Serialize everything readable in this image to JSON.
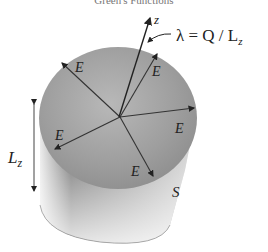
{
  "header": {
    "running_title": "Green's Functions"
  },
  "figure": {
    "axis_label": "z",
    "equation": "λ = Q / L",
    "equation_subscript": "z",
    "field_labels": [
      "E",
      "E",
      "E",
      "E",
      "E",
      "E"
    ],
    "length_label": "L",
    "length_subscript": "z",
    "surface_label": "S"
  }
}
